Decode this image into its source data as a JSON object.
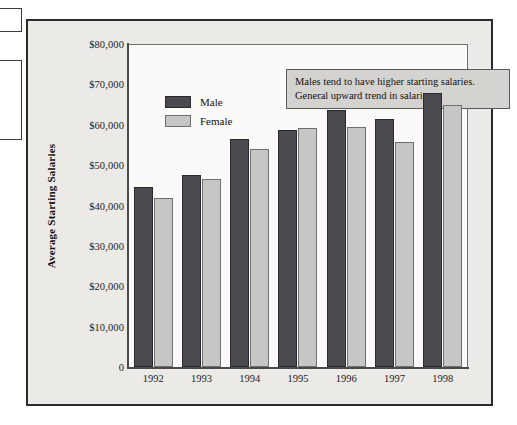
{
  "chart_data": {
    "type": "bar",
    "title": "",
    "xlabel": "",
    "ylabel": "Average Starting Salaries",
    "categories": [
      "1992",
      "1993",
      "1994",
      "1995",
      "1996",
      "1997",
      "1998"
    ],
    "series": [
      {
        "name": "Male",
        "color": "#4a4a4f",
        "values": [
          44500,
          47500,
          56400,
          58600,
          63600,
          61400,
          67900
        ]
      },
      {
        "name": "Female",
        "color": "#c6c6c4",
        "values": [
          41800,
          46500,
          54000,
          59100,
          59400,
          55800,
          65000
        ]
      }
    ],
    "ylim": [
      0,
      80000
    ],
    "ytick_values": [
      80000,
      70000,
      60000,
      50000,
      40000,
      30000,
      20000,
      10000,
      0
    ],
    "ytick_labels": [
      "$80,000",
      "$70,000",
      "$60,000",
      "$50,000",
      "$40,000",
      "$30,000",
      "$20,000",
      "$10,000",
      "0"
    ],
    "grid": false,
    "legend_position": "upper-left",
    "annotations": [
      "Males tend to have higher starting salaries.",
      "General upward trend in salaries."
    ]
  },
  "legend": {
    "items": [
      {
        "label": "Male"
      },
      {
        "label": "Female"
      }
    ]
  },
  "annotation": {
    "lines": [
      "Males tend to have higher starting salaries.",
      "General upward trend in salaries."
    ]
  },
  "axes": {
    "y_title": "Average Starting Salaries"
  }
}
